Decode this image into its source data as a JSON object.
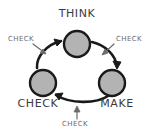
{
  "diagram": {
    "background_color": "#ffffff",
    "node_fill_color": "#b3b3b3",
    "node_stroke_color": "#1a1a1a",
    "arrow_color": "#1a1a1a",
    "annotation_color": "#6b6b6b",
    "node_label_color": "#3a3a3a",
    "nodes": [
      {
        "id": "think",
        "label": "THINK",
        "cx": 77,
        "cy": 44,
        "r": 13,
        "label_x": 77,
        "label_y": 17
      },
      {
        "id": "make",
        "label": "MAKE",
        "cx": 112,
        "cy": 83,
        "r": 13,
        "label_x": 117,
        "label_y": 107
      },
      {
        "id": "check",
        "label": "CHECK",
        "cx": 43,
        "cy": 83,
        "r": 13,
        "label_x": 38,
        "label_y": 107
      }
    ],
    "arrows": [
      {
        "id": "think-to-make",
        "from": "think",
        "to": "make",
        "label": "CHECK"
      },
      {
        "id": "make-to-check",
        "from": "make",
        "to": "check",
        "label": "CHECK"
      },
      {
        "id": "check-to-think",
        "from": "check",
        "to": "think",
        "label": "CHECK"
      }
    ],
    "annotations": [
      {
        "id": "annotation-top-left",
        "label": "CHECK",
        "x": 8,
        "y": 41
      },
      {
        "id": "annotation-top-right",
        "label": "CHECK",
        "x": 116,
        "y": 41
      },
      {
        "id": "annotation-bottom",
        "label": "CHECK",
        "x": 62,
        "y": 126
      }
    ]
  }
}
